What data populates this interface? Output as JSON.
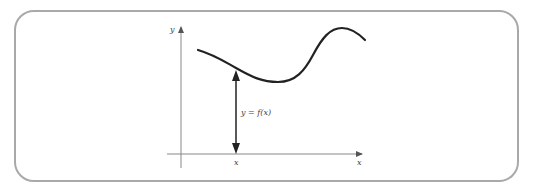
{
  "diagram": {
    "type": "function-graph",
    "labels": {
      "y_axis": "y",
      "x_axis": "x",
      "x_point": "x",
      "function_value": "y = f(x)"
    },
    "colors": {
      "frame_border": "#a9a9a9",
      "axes": "#777777",
      "curve": "#222222",
      "arrow": "#222222"
    },
    "curve_points": [
      [
        198,
        50
      ],
      [
        236,
        68
      ],
      [
        275,
        82
      ],
      [
        300,
        75
      ],
      [
        320,
        45
      ],
      [
        340,
        28
      ],
      [
        365,
        40
      ]
    ]
  }
}
